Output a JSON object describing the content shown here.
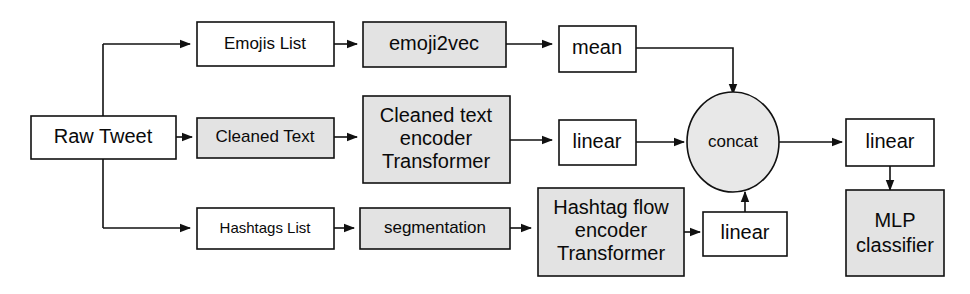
{
  "diagram": {
    "colors": {
      "stroke": "#111111",
      "fill_white": "#ffffff",
      "fill_gray": "#e3e3e3",
      "circle_fill": "#e8e8e8",
      "background": "#ffffff",
      "text": "#0a0a0a"
    },
    "nodes": {
      "raw_tweet": {
        "label": "Raw Tweet",
        "shape": "rect",
        "fill": "white"
      },
      "emojis_list": {
        "label": "Emojis List",
        "shape": "rect",
        "fill": "white"
      },
      "emoji2vec": {
        "label": "emoji2vec",
        "shape": "rect",
        "fill": "gray"
      },
      "mean": {
        "label": "mean",
        "shape": "rect",
        "fill": "white"
      },
      "cleaned_text": {
        "label": "Cleaned Text",
        "shape": "rect",
        "fill": "gray"
      },
      "cleaned_text_encoder": {
        "shape": "rect",
        "fill": "gray",
        "line1": "Cleaned text",
        "line2": "encoder",
        "line3": "Transformer"
      },
      "linear_text": {
        "label": "linear",
        "shape": "rect",
        "fill": "white"
      },
      "hashtags_list": {
        "label": "Hashtags List",
        "shape": "rect",
        "fill": "white"
      },
      "segmentation": {
        "label": "segmentation",
        "shape": "rect",
        "fill": "gray"
      },
      "hashtag_flow_encoder": {
        "shape": "rect",
        "fill": "gray",
        "line1": "Hashtag flow",
        "line2": "encoder",
        "line3": "Transformer"
      },
      "linear_hashtag": {
        "label": "linear",
        "shape": "rect",
        "fill": "white"
      },
      "concat": {
        "label": "concat",
        "shape": "circle",
        "fill": "gray"
      },
      "linear_out": {
        "label": "linear",
        "shape": "rect",
        "fill": "white"
      },
      "mlp_classifier": {
        "shape": "rect",
        "fill": "gray",
        "line1": "MLP",
        "line2": "classifier"
      }
    },
    "edges": [
      {
        "from": "raw_tweet",
        "to": "emojis_list"
      },
      {
        "from": "raw_tweet",
        "to": "cleaned_text"
      },
      {
        "from": "raw_tweet",
        "to": "hashtags_list"
      },
      {
        "from": "emojis_list",
        "to": "emoji2vec"
      },
      {
        "from": "emoji2vec",
        "to": "mean"
      },
      {
        "from": "mean",
        "to": "concat"
      },
      {
        "from": "cleaned_text",
        "to": "cleaned_text_encoder"
      },
      {
        "from": "cleaned_text_encoder",
        "to": "linear_text"
      },
      {
        "from": "linear_text",
        "to": "concat"
      },
      {
        "from": "hashtags_list",
        "to": "segmentation"
      },
      {
        "from": "segmentation",
        "to": "hashtag_flow_encoder"
      },
      {
        "from": "hashtag_flow_encoder",
        "to": "linear_hashtag"
      },
      {
        "from": "linear_hashtag",
        "to": "concat"
      },
      {
        "from": "concat",
        "to": "linear_out"
      },
      {
        "from": "linear_out",
        "to": "mlp_classifier"
      }
    ]
  }
}
